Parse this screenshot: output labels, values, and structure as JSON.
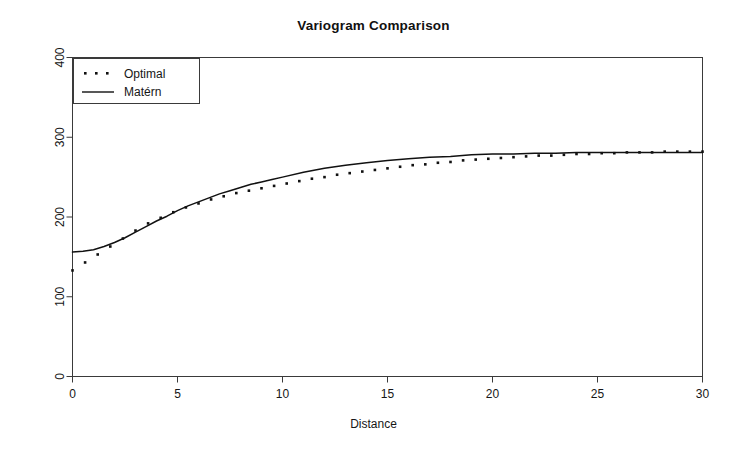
{
  "chart_data": {
    "type": "line",
    "title": "Variogram Comparison",
    "xlabel": "Distance",
    "ylabel": "",
    "xlim": [
      0,
      30
    ],
    "ylim": [
      0,
      400
    ],
    "xticks": [
      0,
      5,
      10,
      15,
      20,
      25,
      30
    ],
    "yticks": [
      0,
      100,
      200,
      300,
      400
    ],
    "grid": false,
    "legend_position": "top-left",
    "legend_entries": [
      "Optimal",
      "Matérn"
    ],
    "series": [
      {
        "name": "Optimal",
        "style": "dotted",
        "color": "#111111",
        "x": [
          0,
          0.6,
          1.2,
          1.8,
          2.4,
          3.0,
          3.6,
          4.2,
          4.8,
          5.4,
          6.0,
          6.6,
          7.2,
          7.8,
          8.4,
          9.0,
          9.6,
          10.2,
          10.8,
          11.4,
          12.0,
          12.6,
          13.2,
          13.8,
          14.4,
          15.0,
          15.6,
          16.2,
          16.8,
          17.4,
          18.0,
          18.6,
          19.2,
          19.8,
          20.4,
          21.0,
          21.6,
          22.2,
          22.8,
          23.4,
          24.0,
          24.6,
          25.2,
          25.8,
          26.4,
          27.0,
          27.6,
          28.2,
          28.8,
          29.4,
          30.0
        ],
        "y": [
          133,
          143,
          153,
          163,
          173,
          183,
          192,
          199,
          206,
          212,
          217,
          222,
          226,
          230,
          233,
          236,
          239,
          242,
          245,
          248,
          250,
          253,
          255,
          257,
          259,
          261,
          263,
          265,
          266,
          268,
          269,
          271,
          272,
          273,
          274,
          275,
          276,
          277,
          277,
          278,
          279,
          279,
          280,
          280,
          281,
          281,
          281,
          282,
          282,
          282,
          282
        ]
      },
      {
        "name": "Matérn",
        "style": "solid",
        "color": "#111111",
        "x": [
          0,
          0.5,
          1.0,
          1.5,
          2.0,
          2.5,
          3.0,
          3.5,
          4.0,
          4.5,
          5.0,
          5.5,
          6.0,
          6.5,
          7.0,
          7.5,
          8.0,
          8.5,
          9.0,
          9.5,
          10.0,
          11.0,
          12.0,
          13.0,
          14.0,
          15.0,
          16.0,
          17.0,
          18.0,
          19.0,
          20.0,
          21.0,
          22.0,
          23.0,
          24.0,
          25.0,
          26.0,
          27.0,
          28.0,
          29.0,
          30.0
        ],
        "y": [
          156,
          157,
          159,
          163,
          168,
          174,
          181,
          188,
          195,
          201,
          208,
          214,
          219,
          224,
          229,
          233,
          237,
          241,
          244,
          247,
          250,
          256,
          261,
          265,
          268,
          271,
          273,
          275,
          276,
          278,
          279,
          279,
          280,
          280,
          281,
          281,
          281,
          281,
          281,
          281,
          281
        ]
      }
    ]
  },
  "legend": {
    "optimal_label": "Optimal",
    "matern_label": "Matérn"
  },
  "axis": {
    "x_tick_labels": [
      "0",
      "5",
      "10",
      "15",
      "20",
      "25",
      "30"
    ],
    "y_tick_labels": [
      "0",
      "100",
      "200",
      "300",
      "400"
    ]
  }
}
